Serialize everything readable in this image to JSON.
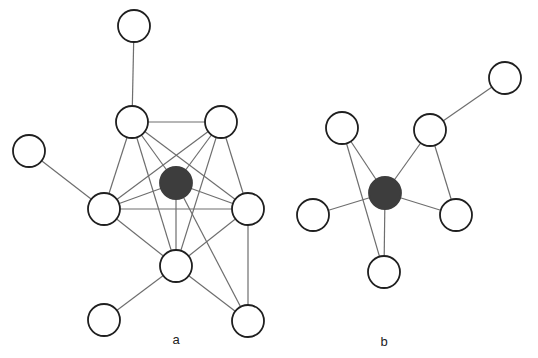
{
  "colors": {
    "edge": "#6e6e6e",
    "node_stroke": "#1f1f1f",
    "node_fill": "#ffffff",
    "hub_fill": "#3d3d3d",
    "label": "#222222"
  },
  "node_radius": 16,
  "diagrams": [
    {
      "id": "a",
      "label": "a",
      "label_pos": [
        176,
        344
      ],
      "nodes": [
        {
          "id": "T",
          "x": 134,
          "y": 26,
          "hub": false
        },
        {
          "id": "TL",
          "x": 132,
          "y": 122,
          "hub": false
        },
        {
          "id": "TR",
          "x": 221,
          "y": 122,
          "hub": false
        },
        {
          "id": "L",
          "x": 29,
          "y": 151,
          "hub": false
        },
        {
          "id": "C",
          "x": 176,
          "y": 183,
          "hub": true
        },
        {
          "id": "ML",
          "x": 104,
          "y": 209,
          "hub": false
        },
        {
          "id": "MR",
          "x": 248,
          "y": 209,
          "hub": false
        },
        {
          "id": "BC",
          "x": 176,
          "y": 266,
          "hub": false
        },
        {
          "id": "BL",
          "x": 104,
          "y": 320,
          "hub": false
        },
        {
          "id": "BR",
          "x": 248,
          "y": 321,
          "hub": false
        }
      ],
      "edges": [
        [
          "T",
          "TL"
        ],
        [
          "TL",
          "TR"
        ],
        [
          "L",
          "ML"
        ],
        [
          "TL",
          "ML"
        ],
        [
          "TL",
          "C"
        ],
        [
          "TL",
          "MR"
        ],
        [
          "TL",
          "BC"
        ],
        [
          "TR",
          "ML"
        ],
        [
          "TR",
          "C"
        ],
        [
          "TR",
          "MR"
        ],
        [
          "TR",
          "BC"
        ],
        [
          "C",
          "ML"
        ],
        [
          "C",
          "MR"
        ],
        [
          "C",
          "BC"
        ],
        [
          "C",
          "BR"
        ],
        [
          "ML",
          "MR"
        ],
        [
          "ML",
          "BC"
        ],
        [
          "MR",
          "BC"
        ],
        [
          "MR",
          "BR"
        ],
        [
          "BC",
          "BL"
        ],
        [
          "BC",
          "BR"
        ]
      ]
    },
    {
      "id": "b",
      "label": "b",
      "label_pos": [
        384,
        346
      ],
      "nodes": [
        {
          "id": "P",
          "x": 342,
          "y": 128,
          "hub": false
        },
        {
          "id": "Q",
          "x": 430,
          "y": 130,
          "hub": false
        },
        {
          "id": "R",
          "x": 505,
          "y": 78,
          "hub": false
        },
        {
          "id": "C",
          "x": 385,
          "y": 193,
          "hub": true
        },
        {
          "id": "S",
          "x": 313,
          "y": 215,
          "hub": false
        },
        {
          "id": "U",
          "x": 456,
          "y": 215,
          "hub": false
        },
        {
          "id": "V",
          "x": 384,
          "y": 272,
          "hub": false
        }
      ],
      "edges": [
        [
          "Q",
          "R"
        ],
        [
          "P",
          "C"
        ],
        [
          "P",
          "V"
        ],
        [
          "Q",
          "C"
        ],
        [
          "Q",
          "U"
        ],
        [
          "C",
          "S"
        ],
        [
          "C",
          "U"
        ],
        [
          "C",
          "V"
        ]
      ]
    }
  ]
}
